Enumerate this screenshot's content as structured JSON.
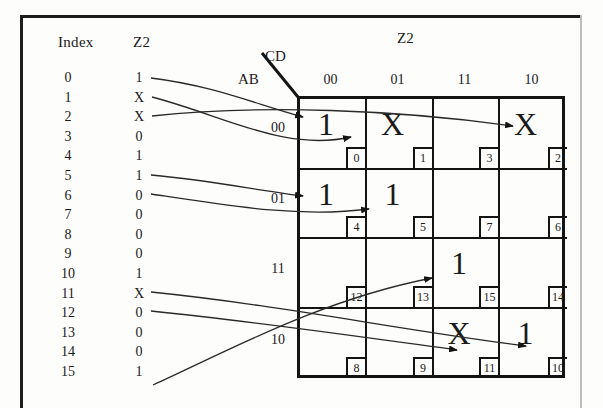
{
  "figure": {
    "kmap_title": "Z2",
    "corner_labels": {
      "columns": "CD",
      "rows": "AB"
    }
  },
  "index_table": {
    "headers": {
      "index": "Index",
      "value": "Z2"
    },
    "rows": [
      {
        "index": "0",
        "value": "1"
      },
      {
        "index": "1",
        "value": "X"
      },
      {
        "index": "2",
        "value": "X"
      },
      {
        "index": "3",
        "value": "0"
      },
      {
        "index": "4",
        "value": "1"
      },
      {
        "index": "5",
        "value": "1"
      },
      {
        "index": "6",
        "value": "0"
      },
      {
        "index": "7",
        "value": "0"
      },
      {
        "index": "8",
        "value": "0"
      },
      {
        "index": "9",
        "value": "0"
      },
      {
        "index": "10",
        "value": "1"
      },
      {
        "index": "11",
        "value": "X"
      },
      {
        "index": "12",
        "value": "0"
      },
      {
        "index": "13",
        "value": "0"
      },
      {
        "index": "14",
        "value": "0"
      },
      {
        "index": "15",
        "value": "1"
      }
    ]
  },
  "kmap": {
    "column_headers": [
      "00",
      "01",
      "11",
      "10"
    ],
    "row_headers": [
      "00",
      "01",
      "11",
      "10"
    ],
    "cells": [
      {
        "minterm": "0",
        "value": "1"
      },
      {
        "minterm": "1",
        "value": "X"
      },
      {
        "minterm": "3",
        "value": ""
      },
      {
        "minterm": "2",
        "value": "X"
      },
      {
        "minterm": "4",
        "value": "1"
      },
      {
        "minterm": "5",
        "value": "1"
      },
      {
        "minterm": "7",
        "value": ""
      },
      {
        "minterm": "6",
        "value": ""
      },
      {
        "minterm": "12",
        "value": ""
      },
      {
        "minterm": "13",
        "value": ""
      },
      {
        "minterm": "15",
        "value": "1"
      },
      {
        "minterm": "14",
        "value": ""
      },
      {
        "minterm": "8",
        "value": ""
      },
      {
        "minterm": "9",
        "value": ""
      },
      {
        "minterm": "11",
        "value": "X"
      },
      {
        "minterm": "10",
        "value": "1"
      }
    ]
  }
}
